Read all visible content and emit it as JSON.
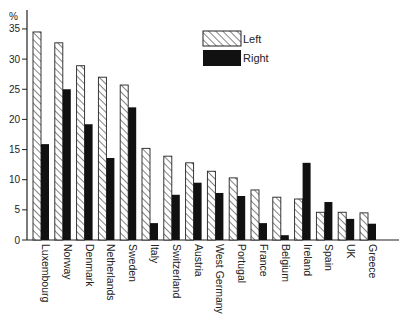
{
  "chart_data": {
    "type": "bar",
    "title": "",
    "xlabel": "",
    "ylabel": "%",
    "ylim": [
      0,
      35
    ],
    "yticks": [
      0,
      5,
      10,
      15,
      20,
      25,
      30,
      35
    ],
    "grid": false,
    "legend_position": "upper-right-center",
    "categories": [
      "Luxembourg",
      "Norway",
      "Denmark",
      "Netherlands",
      "Sweden",
      "Italy",
      "Switzerland",
      "Austria",
      "West Germany",
      "Portugal",
      "France",
      "Belgium",
      "Ireland",
      "Spain",
      "UK",
      "Greece"
    ],
    "series": [
      {
        "name": "Left",
        "style": "hatched",
        "values": [
          34.5,
          32.7,
          28.9,
          27.0,
          25.7,
          15.2,
          13.9,
          12.8,
          11.4,
          10.3,
          8.3,
          7.1,
          6.8,
          4.6,
          4.6,
          4.5
        ]
      },
      {
        "name": "Right",
        "style": "solid-black",
        "values": [
          15.9,
          25.0,
          19.2,
          13.6,
          22.0,
          2.8,
          7.5,
          9.5,
          7.8,
          7.3,
          2.8,
          0.8,
          12.8,
          6.3,
          3.5,
          2.7
        ]
      }
    ]
  },
  "legend": {
    "items": [
      {
        "label": "Left"
      },
      {
        "label": "Right"
      }
    ]
  },
  "axis": {
    "y_unit": "%"
  }
}
